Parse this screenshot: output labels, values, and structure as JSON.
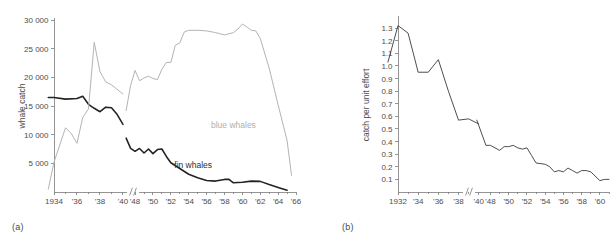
{
  "figure": {
    "panel_a_label": "(a)",
    "panel_b_label": "(b)"
  },
  "chart_data": [
    {
      "id": "panel_a",
      "type": "line",
      "title": "",
      "xlabel": "",
      "ylabel": "whale catch",
      "ylim": [
        0,
        30000
      ],
      "yticks": [
        5000,
        10000,
        15000,
        20000,
        25000,
        30000
      ],
      "ytick_labels": [
        "5 000",
        "10 000",
        "15 000",
        "20 000",
        "25 000",
        "30 000"
      ],
      "grid": false,
      "legend": "inline-annotations",
      "axis_break": {
        "between": [
          1941,
          1946
        ],
        "style": "double-slash"
      },
      "xticks": [
        1934,
        1936,
        1938,
        1940,
        1948,
        1950,
        1952,
        1954,
        1956,
        1958,
        1960,
        1962,
        1964,
        1966
      ],
      "xtick_labels": [
        "1934",
        "'36",
        "'38",
        "'40",
        "'48",
        "'50",
        "'52",
        "'54",
        "'56",
        "'58",
        "'60",
        "'62",
        "'64",
        "'66"
      ],
      "annotations": [
        {
          "text": "blue whales",
          "x": 1959,
          "y": 11200,
          "color": "#b0b0b0"
        },
        {
          "text": "fin whales",
          "x": 1954.5,
          "y": 4200,
          "color": "#2e2e2e"
        }
      ],
      "series": [
        {
          "name": "fin whales",
          "color": "#222222",
          "segments": [
            {
              "x": [
                1933.5,
                1934,
                1935,
                1936,
                1936.5,
                1937,
                1937.5,
                1938,
                1938.5,
                1939,
                1939.5,
                1940
              ],
              "y": [
                16500,
                16500,
                16200,
                16300,
                16700,
                15300,
                14600,
                14000,
                14800,
                14700,
                13500,
                11800
              ]
            },
            {
              "x": [
                1947,
                1947.5,
                1948,
                1948.5,
                1949,
                1949.5,
                1950,
                1950.5,
                1951,
                1951.5,
                1952,
                1953,
                1954,
                1955,
                1956,
                1957,
                1958,
                1958.5,
                1959,
                1960,
                1961,
                1962,
                1963,
                1964,
                1965
              ],
              "y": [
                9400,
                7600,
                7100,
                7600,
                6800,
                7500,
                6700,
                7400,
                7500,
                6200,
                5100,
                4100,
                3100,
                2500,
                2000,
                1900,
                2200,
                2200,
                1600,
                1700,
                1900,
                1850,
                1300,
                800,
                300
              ]
            }
          ]
        },
        {
          "name": "blue whales",
          "color": "#b4b4b4",
          "segments": [
            {
              "x": [
                1933.5,
                1934,
                1935,
                1935.5,
                1936,
                1936.5,
                1937,
                1937.5,
                1938,
                1938.5,
                1939,
                1940
              ],
              "y": [
                500,
                5200,
                11200,
                10200,
                8500,
                13000,
                14500,
                26100,
                21000,
                19200,
                18700,
                17100
              ]
            },
            {
              "x": [
                1947,
                1947.5,
                1948,
                1948.5,
                1949,
                1949.5,
                1950,
                1950.5,
                1951,
                1951.5,
                1952,
                1952.5,
                1953,
                1953.5,
                1954,
                1955,
                1956,
                1957,
                1958,
                1959,
                1959.5,
                1960,
                1960.5,
                1961,
                1961.5,
                1962,
                1963,
                1964,
                1965,
                1965.5
              ],
              "y": [
                14200,
                18600,
                21200,
                19400,
                19900,
                20200,
                19800,
                19600,
                21400,
                22600,
                22600,
                25600,
                26000,
                27900,
                28200,
                28200,
                28100,
                27800,
                27400,
                27800,
                28400,
                29300,
                28800,
                28200,
                28100,
                26800,
                21600,
                15200,
                9000,
                2900
              ]
            }
          ]
        }
      ]
    },
    {
      "id": "panel_b",
      "type": "line",
      "title": "",
      "xlabel": "",
      "ylabel": "catch per unit effort",
      "ylim": [
        0,
        1.38
      ],
      "yticks": [
        0.1,
        0.2,
        0.3,
        0.4,
        0.5,
        0.6,
        0.7,
        0.8,
        0.9,
        1.0,
        1.1,
        1.2,
        1.3
      ],
      "ytick_labels": [
        "0.1",
        "0.2",
        "0.3",
        "0.4",
        "0.5",
        "0.6",
        "0.7",
        "0.8",
        "0.9",
        "1.0",
        "1.1",
        "1.2",
        "1.3"
      ],
      "grid": false,
      "axis_break": {
        "between": [
          1941,
          1946
        ],
        "style": "double-slash"
      },
      "xticks": [
        1932,
        1934,
        1936,
        1938,
        1940,
        1948,
        1950,
        1952,
        1954,
        1956,
        1958,
        1960
      ],
      "xtick_labels": [
        "1932",
        "'34",
        "'36",
        "'38",
        "'40",
        "'48",
        "'50",
        "'52",
        "'54",
        "'56",
        "'58",
        "'60"
      ],
      "series": [
        {
          "name": "catch per unit effort",
          "color": "#3a3a3a",
          "segments": [
            {
              "x": [
                1931,
                1932,
                1933,
                1934,
                1935,
                1936,
                1937,
                1938,
                1939,
                1940
              ],
              "y": [
                1.03,
                1.32,
                1.26,
                0.95,
                0.95,
                1.05,
                0.8,
                0.57,
                0.58,
                0.54
              ]
            },
            {
              "x": [
                1946.5,
                1947.5,
                1948,
                1949,
                1949.5,
                1950,
                1950.5,
                1951,
                1951.5,
                1952,
                1952.5,
                1953,
                1954,
                1954.5,
                1955,
                1955.5,
                1956,
                1956.5,
                1957,
                1957.5,
                1958,
                1958.5,
                1959,
                1960,
                1960.5,
                1961
              ],
              "y": [
                0.57,
                0.37,
                0.37,
                0.33,
                0.36,
                0.36,
                0.37,
                0.35,
                0.34,
                0.35,
                0.29,
                0.23,
                0.22,
                0.2,
                0.16,
                0.17,
                0.16,
                0.19,
                0.17,
                0.15,
                0.17,
                0.17,
                0.16,
                0.09,
                0.1,
                0.1
              ]
            }
          ]
        }
      ]
    }
  ]
}
